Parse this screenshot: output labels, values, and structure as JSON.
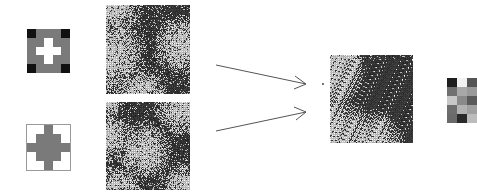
{
  "figure": {
    "colors": {
      "background": "#ffffff",
      "black": "#111111",
      "dark_gray": "#3a3a3a",
      "mid_gray": "#7a7a7a",
      "light_gray": "#b5b5b5",
      "white": "#ffffff",
      "arrow": "#555555"
    },
    "filters": [
      {
        "id": "filter-1",
        "rows": [
          [
            "k",
            "g",
            "g",
            "g",
            "k"
          ],
          [
            "g",
            "g",
            "w",
            "g",
            "g"
          ],
          [
            "g",
            "w",
            "w",
            "w",
            "g"
          ],
          [
            "g",
            "g",
            "w",
            "g",
            "g"
          ],
          [
            "k",
            "g",
            "g",
            "g",
            "k"
          ]
        ]
      },
      {
        "id": "filter-2",
        "rows": [
          [
            "w",
            "w",
            "g",
            "w",
            "w"
          ],
          [
            "w",
            "g",
            "g",
            "g",
            "w"
          ],
          [
            "g",
            "g",
            "g",
            "g",
            "g"
          ],
          [
            "w",
            "g",
            "g",
            "g",
            "w"
          ],
          [
            "w",
            "w",
            "g",
            "w",
            "w"
          ]
        ]
      }
    ],
    "textures": [
      {
        "id": "texture-1",
        "seed": 11,
        "blobs": [
          [
            0.0,
            0.0,
            0.45
          ],
          [
            0.0,
            0.55,
            0.5
          ],
          [
            0.9,
            0.45,
            0.35
          ],
          [
            0.4,
            1.0,
            0.35
          ]
        ]
      },
      {
        "id": "texture-2",
        "seed": 23,
        "blobs": [
          [
            0.0,
            0.0,
            0.2
          ],
          [
            0.9,
            0.05,
            0.35
          ],
          [
            0.45,
            0.55,
            0.35
          ],
          [
            0.15,
            1.0,
            0.3
          ],
          [
            0.95,
            1.0,
            0.35
          ],
          [
            0.0,
            0.4,
            0.3
          ]
        ]
      },
      {
        "id": "output-texture",
        "seed": 37,
        "blobs": [
          [
            0.0,
            0.2,
            0.45
          ],
          [
            0.0,
            0.9,
            0.5
          ],
          [
            0.5,
            1.0,
            0.4
          ],
          [
            0.1,
            0.0,
            0.35
          ]
        ]
      }
    ],
    "patch_grid": {
      "id": "patch-grid",
      "rows": [
        [
          "#1e1e1e",
          "#f2f2f2",
          "#555555"
        ],
        [
          "#707070",
          "#a8a8a8",
          "#9a9a9a"
        ],
        [
          "#c8c8c8",
          "#8a8a8a",
          "#5a5a5a"
        ],
        [
          "#6e6e6e",
          "#b2b2b2",
          "#a0a0a0"
        ],
        [
          "#6a6a6a",
          "#2a2a2a",
          "#bcbcbc"
        ]
      ]
    },
    "arrows": [
      {
        "id": "arrow-top",
        "from": [
          216,
          65
        ],
        "to": [
          306,
          84
        ]
      },
      {
        "id": "arrow-bottom",
        "from": [
          216,
          131
        ],
        "to": [
          306,
          112
        ]
      }
    ]
  }
}
